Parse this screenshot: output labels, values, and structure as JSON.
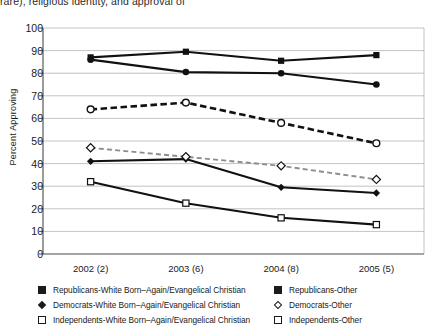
{
  "cut_header_text": "rare), religious identity, and approval of",
  "chart_data": {
    "type": "line",
    "title": "",
    "xlabel": "",
    "ylabel": "Percent Approving",
    "categories": [
      "2002 (2)",
      "2003 (6)",
      "2004 (8)",
      "2005 (5)"
    ],
    "ylim": [
      0,
      100
    ],
    "yticks": [
      0,
      10,
      20,
      30,
      40,
      50,
      60,
      70,
      80,
      90,
      100
    ],
    "grid": true,
    "legend_position": "bottom",
    "series": [
      {
        "name": "Republicans-White Born–Again/Evangelical Christian",
        "marker": "filled-square",
        "line": "solid",
        "values": [
          87,
          89.5,
          85.5,
          88
        ]
      },
      {
        "name": "Republicans-Other",
        "marker": "open-circle",
        "line": "dashed",
        "values": [
          64,
          67,
          58,
          49
        ]
      },
      {
        "name": "Democrats-White Born–Again/Evangelical Christian",
        "marker": "filled-diamond",
        "line": "solid",
        "values": [
          41,
          42,
          29.5,
          27
        ]
      },
      {
        "name": "Democrats-Other",
        "marker": "open-diamond",
        "line": "dashed",
        "values": [
          47,
          43,
          39,
          33
        ]
      },
      {
        "name": "Independents-White Born–Again/Evangelical Christian",
        "marker": "filled-circle",
        "line": "solid",
        "values": [
          86,
          80.5,
          80,
          75
        ]
      },
      {
        "name": "Independents-Other",
        "marker": "open-square",
        "line": "solid",
        "values": [
          32,
          22.5,
          16,
          13
        ]
      }
    ]
  },
  "legend": {
    "left_items": [
      {
        "marker": "filled-square",
        "label": "Republicans-White Born–Again/Evangelical Christian"
      },
      {
        "marker": "filled-diamond",
        "label": "Democrats-White Born–Again/Evangelical Christian"
      },
      {
        "marker": "open-square",
        "label": "Independents-White Born–Again/Evangelical Christian"
      }
    ],
    "right_items": [
      {
        "marker": "filled-square",
        "label": "Republicans-Other"
      },
      {
        "marker": "open-diamond",
        "label": "Democrats-Other"
      },
      {
        "marker": "open-square",
        "label": "Independents-Other"
      }
    ]
  }
}
